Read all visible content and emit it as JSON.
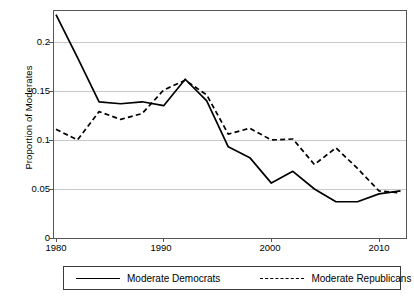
{
  "chart_data": {
    "type": "line",
    "title": "",
    "xlabel": "",
    "ylabel": "Proportion of Moderates",
    "xlim": [
      1979,
      2013
    ],
    "ylim": [
      0,
      0.232
    ],
    "grid": "horizontal",
    "legend_position": "bottom",
    "x": [
      1980,
      1982,
      1984,
      1986,
      1988,
      1990,
      1992,
      1994,
      1996,
      1998,
      2000,
      2002,
      2004,
      2006,
      2008,
      2010,
      2012
    ],
    "xticks": [
      "1980",
      "1990",
      "2000",
      "2010"
    ],
    "xtick_values": [
      1980,
      1990,
      2000,
      2010
    ],
    "yticks": [
      "0",
      "0.05",
      "0.1",
      "0.15",
      "0.2"
    ],
    "ytick_values": [
      0,
      0.05,
      0.1,
      0.15,
      0.2
    ],
    "series": [
      {
        "name": "Moderate Democrats",
        "style": "solid",
        "color": "#000000",
        "values": [
          0.228,
          0.184,
          0.139,
          0.137,
          0.139,
          0.135,
          0.162,
          0.14,
          0.093,
          0.082,
          0.056,
          0.068,
          0.05,
          0.037,
          0.037,
          0.045,
          0.048
        ]
      },
      {
        "name": "Moderate Republicans",
        "style": "dashed",
        "color": "#000000",
        "values": [
          0.111,
          0.1,
          0.129,
          0.121,
          0.127,
          0.151,
          0.161,
          0.146,
          0.106,
          0.112,
          0.1,
          0.101,
          0.075,
          0.092,
          0.071,
          0.048,
          0.046
        ]
      }
    ]
  },
  "axis": {
    "y_title": "Proportion of Moderates",
    "y_ticks": [
      "0.2",
      "0.15",
      "0.1",
      "0.05",
      "0"
    ],
    "x_ticks": [
      "1980",
      "1990",
      "2000",
      "2010"
    ]
  },
  "legend": {
    "democrats_label": "Moderate Democrats",
    "republicans_label": "Moderate Republicans"
  }
}
